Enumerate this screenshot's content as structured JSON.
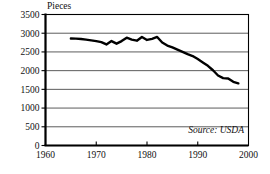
{
  "chart_data": {
    "type": "line",
    "title": "",
    "xlabel": "",
    "ylabel": "Pieces",
    "ylim": [
      0,
      3500
    ],
    "xlim": [
      1960,
      2000
    ],
    "grid": true,
    "legend": null,
    "yticks": [
      "0",
      "500",
      "1000",
      "1500",
      "2000",
      "2500",
      "3000",
      "3500"
    ],
    "ytick_values": [
      0,
      500,
      1000,
      1500,
      2000,
      2500,
      3000,
      3500
    ],
    "xticks": [
      "1960",
      "1970",
      "1980",
      "1990",
      "2000"
    ],
    "xtick_values": [
      1960,
      1970,
      1980,
      1990,
      2000
    ],
    "annotations": [
      {
        "text": "Source: USDA",
        "position": "bottom-right",
        "style": "italic"
      }
    ],
    "series": [
      {
        "name": "Pieces",
        "color": "#000000",
        "x": [
          1965,
          1966,
          1967,
          1968,
          1969,
          1970,
          1971,
          1972,
          1973,
          1974,
          1975,
          1976,
          1977,
          1978,
          1979,
          1980,
          1981,
          1982,
          1983,
          1984,
          1985,
          1986,
          1987,
          1988,
          1989,
          1990,
          1991,
          1992,
          1993,
          1994,
          1995,
          1996,
          1997,
          1998
        ],
        "values": [
          2860,
          2855,
          2845,
          2830,
          2810,
          2790,
          2760,
          2700,
          2790,
          2720,
          2790,
          2880,
          2830,
          2800,
          2900,
          2820,
          2850,
          2900,
          2750,
          2670,
          2620,
          2560,
          2500,
          2440,
          2390,
          2310,
          2220,
          2130,
          2010,
          1870,
          1800,
          1790,
          1700,
          1660
        ]
      }
    ]
  },
  "labels": {
    "y_axis_title": "Pieces",
    "source": "Source: USDA"
  }
}
